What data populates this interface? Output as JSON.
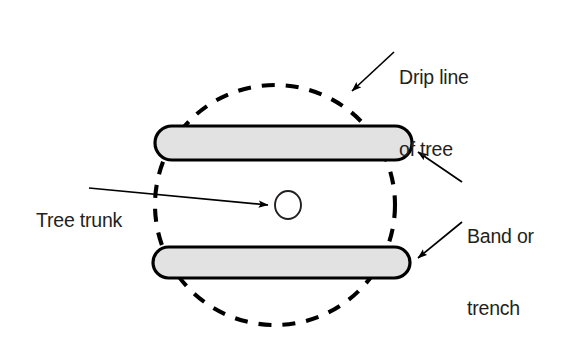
{
  "figure": {
    "type": "labeled-diagram",
    "background_color": "#ffffff"
  },
  "labels": {
    "drip_line": {
      "line1": "Drip line",
      "line2": "of tree"
    },
    "band_trench": {
      "line1": "Band or",
      "line2": "trench"
    },
    "tree_trunk": {
      "line1": "Tree trunk"
    }
  },
  "shapes": {
    "drip_line_circle": {
      "name": "drip-line-of-tree",
      "style": "dashed",
      "stroke_color": "#000000",
      "fill": "none",
      "center_x": 275,
      "center_y": 205,
      "radius_x": 120,
      "radius_y": 120
    },
    "upper_band": {
      "name": "band-or-trench-upper",
      "style": "rounded-rectangle",
      "fill_color": "#e2e2e2",
      "stroke_color": "#000000",
      "x": 155,
      "y": 126,
      "width": 257,
      "height": 34
    },
    "lower_band": {
      "name": "band-or-trench-lower",
      "style": "rounded-rectangle",
      "fill_color": "#e2e2e2",
      "stroke_color": "#000000",
      "x": 153,
      "y": 247,
      "width": 257,
      "height": 31
    },
    "tree_trunk_circle": {
      "name": "tree-trunk",
      "style": "solid-outline",
      "fill": "none",
      "stroke_color": "#231f20",
      "center_x": 288,
      "center_y": 205,
      "radius_x": 13,
      "radius_y": 14
    }
  },
  "leaders": [
    {
      "name": "drip-line-leader",
      "from_label": "drip_line",
      "from_x": 394,
      "from_y": 52,
      "to_x": 352,
      "to_y": 91,
      "arrowhead": true
    },
    {
      "name": "band-trench-leader-upper",
      "from_label": "band_trench",
      "from_x": 462,
      "from_y": 182,
      "to_x": 417,
      "to_y": 151,
      "arrowhead": true
    },
    {
      "name": "band-trench-leader-lower",
      "from_label": "band_trench",
      "from_x": 462,
      "from_y": 222,
      "to_x": 417,
      "to_y": 258,
      "arrowhead": true
    },
    {
      "name": "tree-trunk-leader",
      "from_label": "tree_trunk",
      "from_x": 89,
      "from_y": 188,
      "to_x": 268,
      "to_y": 205,
      "arrowhead": true
    }
  ],
  "colors": {
    "ink": "#000000",
    "text": "#231f20",
    "band_fill": "#e2e2e2",
    "background": "#ffffff"
  }
}
